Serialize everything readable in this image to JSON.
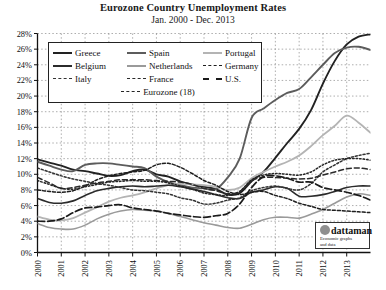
{
  "header": {
    "title": "Eurozone Country Unemployment Rates",
    "subtitle": "Jan. 2000 - Dec. 2013"
  },
  "logo": {
    "word": "dattaman",
    "tagline_line1": "Economic graphs",
    "tagline_line2": "and data"
  },
  "chart_data": {
    "type": "line",
    "title": "Eurozone Country Unemployment Rates",
    "subtitle": "Jan. 2000 - Dec. 2013",
    "xlabel": "",
    "ylabel": "",
    "xlim": [
      2000,
      2014
    ],
    "ylim": [
      0,
      28
    ],
    "ytick_step": 2,
    "grid": true,
    "legend_position": "upper-left-inside",
    "ytick_labels": [
      "0%",
      "2%",
      "4%",
      "6%",
      "8%",
      "10%",
      "12%",
      "14%",
      "16%",
      "18%",
      "20%",
      "22%",
      "24%",
      "26%",
      "28%"
    ],
    "ytick_values": [
      0,
      2,
      4,
      6,
      8,
      10,
      12,
      14,
      16,
      18,
      20,
      22,
      24,
      26,
      28
    ],
    "xtick_labels": [
      "2000",
      "2001",
      "2002",
      "2003",
      "2004",
      "2005",
      "2006",
      "2007",
      "2008",
      "2009",
      "2010",
      "2011",
      "2012",
      "2013"
    ],
    "xtick_values": [
      2000,
      2001,
      2002,
      2003,
      2004,
      2005,
      2006,
      2007,
      2008,
      2009,
      2010,
      2011,
      2012,
      2013
    ],
    "x": [
      2000,
      2000.5,
      2001,
      2001.5,
      2002,
      2002.5,
      2003,
      2003.5,
      2004,
      2004.5,
      2005,
      2005.5,
      2006,
      2006.5,
      2007,
      2007.5,
      2008,
      2008.5,
      2009,
      2009.5,
      2010,
      2010.5,
      2011,
      2011.5,
      2012,
      2012.5,
      2013,
      2013.5,
      2014
    ],
    "series": [
      {
        "name": "Greece",
        "color": "#222222",
        "width": 1.9,
        "dash": "none",
        "values": [
          11.9,
          11.5,
          11.1,
          10.6,
          10.4,
          10.1,
          9.8,
          9.9,
          10.4,
          10.6,
          10.0,
          9.7,
          9.1,
          8.7,
          8.4,
          8.1,
          7.4,
          7.6,
          9.1,
          10.3,
          12.1,
          14.0,
          15.8,
          18.2,
          21.6,
          24.5,
          26.6,
          27.6,
          27.9
        ]
      },
      {
        "name": "Spain",
        "color": "#5c5c5c",
        "width": 1.9,
        "dash": "none",
        "values": [
          11.6,
          11.1,
          10.6,
          10.4,
          11.2,
          11.4,
          11.4,
          11.2,
          11.0,
          10.8,
          9.7,
          9.0,
          8.6,
          8.3,
          8.2,
          8.1,
          9.6,
          12.0,
          17.2,
          18.4,
          19.5,
          20.4,
          20.9,
          22.4,
          24.0,
          25.5,
          26.2,
          26.3,
          25.9
        ]
      },
      {
        "name": "Portugal",
        "color": "#b4b4b4",
        "width": 1.8,
        "dash": "none",
        "values": [
          4.6,
          4.2,
          4.1,
          4.4,
          5.1,
          5.8,
          6.5,
          7.0,
          7.3,
          7.7,
          8.2,
          8.6,
          8.8,
          8.7,
          8.6,
          8.4,
          8.0,
          8.3,
          9.5,
          10.3,
          11.0,
          11.6,
          12.4,
          13.6,
          15.0,
          16.2,
          17.5,
          16.6,
          15.3
        ]
      },
      {
        "name": "Belgium",
        "color": "#2b2b2b",
        "width": 1.6,
        "dash": "none",
        "values": [
          6.9,
          6.4,
          6.3,
          6.6,
          7.3,
          7.9,
          8.2,
          8.4,
          8.5,
          8.4,
          8.5,
          8.6,
          8.4,
          8.1,
          7.8,
          7.4,
          7.0,
          6.9,
          7.7,
          8.0,
          8.4,
          8.2,
          7.2,
          7.2,
          7.4,
          7.8,
          8.3,
          8.5,
          8.5
        ]
      },
      {
        "name": "Netherlands",
        "color": "#9a9a9a",
        "width": 1.6,
        "dash": "none",
        "values": [
          3.7,
          3.2,
          3.0,
          3.0,
          3.5,
          4.3,
          4.9,
          5.3,
          5.5,
          5.4,
          5.3,
          5.0,
          4.6,
          4.2,
          3.8,
          3.5,
          3.2,
          3.1,
          3.6,
          4.2,
          4.5,
          4.5,
          4.4,
          4.9,
          5.5,
          6.3,
          7.1,
          7.5,
          7.3
        ]
      },
      {
        "name": "Germany",
        "color": "#1e1e1e",
        "width": 1.5,
        "dash": "3,2",
        "values": [
          8.0,
          7.8,
          7.7,
          7.9,
          8.5,
          9.3,
          9.8,
          10.1,
          10.3,
          10.5,
          11.2,
          11.4,
          10.9,
          10.1,
          9.2,
          8.6,
          7.8,
          7.4,
          7.7,
          7.8,
          7.3,
          6.9,
          6.3,
          5.9,
          5.5,
          5.4,
          5.3,
          5.2,
          5.1
        ]
      },
      {
        "name": "Italy",
        "color": "#333333",
        "width": 1.5,
        "dash": "2,2",
        "values": [
          10.8,
          10.3,
          9.8,
          9.4,
          9.1,
          8.8,
          8.6,
          8.3,
          8.0,
          7.9,
          7.7,
          7.5,
          7.0,
          6.7,
          6.2,
          6.3,
          6.7,
          7.0,
          7.9,
          8.3,
          8.5,
          8.2,
          8.0,
          8.8,
          10.3,
          11.2,
          12.0,
          12.4,
          12.7
        ]
      },
      {
        "name": "France",
        "color": "#2a2a2a",
        "width": 1.5,
        "dash": "5,3",
        "values": [
          9.6,
          8.9,
          8.2,
          8.3,
          8.6,
          8.9,
          9.1,
          9.3,
          9.3,
          9.3,
          9.2,
          9.1,
          9.0,
          8.7,
          8.2,
          7.9,
          7.5,
          7.8,
          9.2,
          9.6,
          9.6,
          9.5,
          9.4,
          9.5,
          9.9,
          10.3,
          10.7,
          10.8,
          10.6
        ]
      },
      {
        "name": "U.S.",
        "color": "#1a1a1a",
        "width": 1.7,
        "dash": "7,3",
        "values": [
          4.0,
          4.0,
          4.3,
          5.1,
          5.7,
          5.8,
          6.0,
          6.1,
          5.7,
          5.5,
          5.3,
          5.0,
          4.8,
          4.6,
          4.5,
          4.7,
          5.0,
          6.2,
          8.3,
          9.7,
          9.8,
          9.5,
          9.0,
          9.0,
          8.3,
          8.0,
          7.7,
          7.3,
          6.7
        ]
      },
      {
        "name": "Eurozone (18)",
        "color": "#262626",
        "width": 1.5,
        "dash": "1.5,2",
        "values": [
          9.2,
          8.7,
          8.2,
          8.1,
          8.4,
          8.7,
          9.0,
          9.1,
          9.2,
          9.1,
          9.1,
          8.9,
          8.5,
          8.1,
          7.6,
          7.4,
          7.3,
          7.8,
          9.3,
          9.9,
          10.1,
          10.0,
          9.9,
          10.3,
          11.2,
          11.8,
          12.0,
          12.0,
          11.8
        ]
      }
    ]
  },
  "legend": {
    "entries": [
      {
        "label": "Greece",
        "color": "#222222",
        "dash": "none",
        "width": 2.2
      },
      {
        "label": "Spain",
        "color": "#5c5c5c",
        "dash": "none",
        "width": 2.2
      },
      {
        "label": "Portugal",
        "color": "#b4b4b4",
        "dash": "none",
        "width": 2.0
      },
      {
        "label": "Belgium",
        "color": "#2b2b2b",
        "dash": "none",
        "width": 2.0
      },
      {
        "label": "Netherlands",
        "color": "#9a9a9a",
        "dash": "none",
        "width": 2.0
      },
      {
        "label": "Germany",
        "color": "#1e1e1e",
        "dash": "2,1.6",
        "width": 1.8
      },
      {
        "label": "Italy",
        "color": "#333333",
        "dash": "2,1.6",
        "width": 1.8
      },
      {
        "label": "France",
        "color": "#2a2a2a",
        "dash": "3.5,2",
        "width": 1.8
      },
      {
        "label": "U.S.",
        "color": "#1a1a1a",
        "dash": "5,2.5",
        "width": 2.0
      },
      {
        "label": "Eurozone (18)",
        "color": "#262626",
        "dash": "1.4,1.6",
        "width": 1.6
      }
    ]
  }
}
